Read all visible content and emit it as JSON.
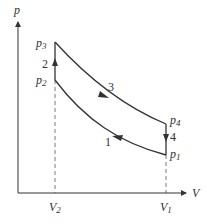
{
  "diagram": {
    "axes": {
      "y_label": "p",
      "x_label": "V"
    },
    "pressure_labels": [
      {
        "id": "p3",
        "base": "p",
        "sub": "3"
      },
      {
        "id": "p2",
        "base": "p",
        "sub": "2"
      },
      {
        "id": "p4",
        "base": "p",
        "sub": "4"
      },
      {
        "id": "p1",
        "base": "p",
        "sub": "1"
      }
    ],
    "volume_labels": [
      {
        "id": "V2",
        "base": "V",
        "sub": "2"
      },
      {
        "id": "V1",
        "base": "V",
        "sub": "1"
      }
    ],
    "process_labels": {
      "one": "1",
      "two": "2",
      "three": "3",
      "four": "4"
    },
    "colors": {
      "line": "#333333",
      "background": "#ffffff"
    }
  }
}
